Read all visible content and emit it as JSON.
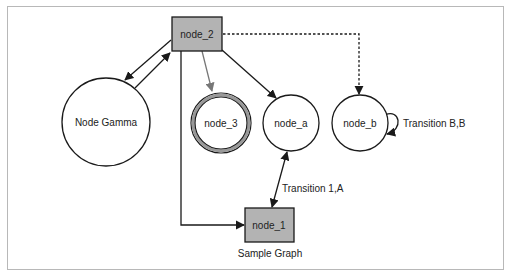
{
  "diagram": {
    "type": "state-graph",
    "caption": "Sample Graph",
    "nodes": {
      "node_2": {
        "label": "node_2",
        "shape": "box",
        "fill": "#b3b3b3"
      },
      "node_1": {
        "label": "node_1",
        "shape": "box",
        "fill": "#b3b3b3"
      },
      "node_gamma": {
        "label": "Node Gamma",
        "shape": "circle",
        "fill": "#ffffff"
      },
      "node_3": {
        "label": "node_3",
        "shape": "double-circle",
        "fill": "#ffffff",
        "ring_color": "#999999"
      },
      "node_a": {
        "label": "node_a",
        "shape": "circle",
        "fill": "#ffffff"
      },
      "node_b": {
        "label": "node_b",
        "shape": "circle",
        "fill": "#ffffff"
      }
    },
    "edges": [
      {
        "from": "node_2",
        "to": "node_gamma",
        "style": "solid",
        "label": ""
      },
      {
        "from": "node_gamma",
        "to": "node_2",
        "style": "solid",
        "label": ""
      },
      {
        "from": "node_2",
        "to": "node_3",
        "style": "solid-gray",
        "label": ""
      },
      {
        "from": "node_2",
        "to": "node_a",
        "style": "solid",
        "label": ""
      },
      {
        "from": "node_2",
        "to": "node_b",
        "style": "dotted",
        "label": ""
      },
      {
        "from": "node_2",
        "to": "node_1",
        "style": "solid",
        "label": ""
      },
      {
        "from": "node_a",
        "to": "node_1",
        "style": "solid-bidirectional",
        "label": "Transition 1,A"
      },
      {
        "from": "node_b",
        "to": "node_b",
        "style": "self-loop",
        "label": "Transition B,B"
      }
    ],
    "labels": {
      "transition_1a": "Transition 1,A",
      "transition_bb": "Transition B,B"
    },
    "colors": {
      "stroke": "#1a1a1a",
      "gray_edge": "#777777",
      "box_fill": "#b3b3b3",
      "frame": "#b8b8b8"
    }
  }
}
